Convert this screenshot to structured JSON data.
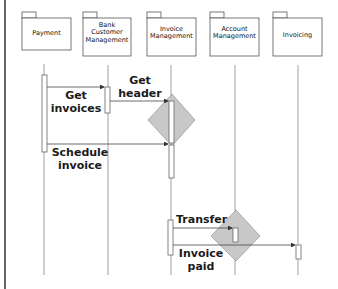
{
  "diagram": {
    "type": "sequence",
    "packages": [
      {
        "id": "payment",
        "label": "Payment"
      },
      {
        "id": "bank",
        "label": "Bank Customer Management"
      },
      {
        "id": "invoice_mgmt",
        "label": "Invoice Management"
      },
      {
        "id": "account",
        "label": "Account Management"
      },
      {
        "id": "invoicing",
        "label": "Invoicing"
      }
    ],
    "messages": [
      {
        "from": "payment",
        "to": "bank",
        "label": "Get invoices"
      },
      {
        "from": "bank",
        "to": "invoice_mgmt",
        "label": "Get header"
      },
      {
        "from": "payment",
        "to": "invoice_mgmt",
        "label": "Schedule invoice"
      },
      {
        "from": "invoice_mgmt",
        "to": "account",
        "label": "Transfer"
      },
      {
        "from": "invoice_mgmt",
        "to": "invoicing",
        "label": "Invoice paid"
      }
    ],
    "colors": {
      "diamond": "#c8c8c8",
      "line": "#555555",
      "border": "#333333"
    }
  },
  "labels": {
    "p0a": "Payment",
    "p1a": "Bank",
    "p1b": "Customer",
    "p1c": "Management",
    "p2a": "Invoice",
    "p2b": "Management",
    "p3a": "Account",
    "p3b": "Management",
    "p4a": "Invoicing",
    "m1a": "Get",
    "m1b": "invoices",
    "m2a": "Get",
    "m2b": "header",
    "m3a": "Schedule",
    "m3b": "invoice",
    "m4a": "Transfer",
    "m5a": "Invoice",
    "m5b": "paid"
  }
}
